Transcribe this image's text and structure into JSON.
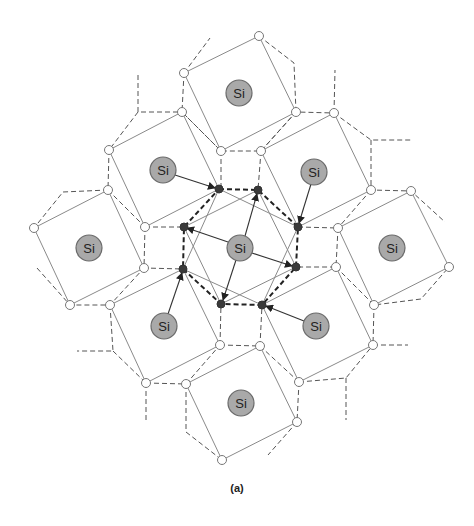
{
  "figure": {
    "caption": "(a)",
    "atom_label": "Si",
    "colors": {
      "si_fill": "#a9a9a9",
      "dark_node": "#3a3a3a",
      "solid_line": "#8a8a8a",
      "dashed_line": "#555555"
    },
    "si_atoms": [
      {
        "id": "center",
        "x": 240,
        "y": 248
      },
      {
        "id": "top",
        "x": 239,
        "y": 93
      },
      {
        "id": "top-left",
        "x": 163,
        "y": 170
      },
      {
        "id": "top-right",
        "x": 314,
        "y": 172
      },
      {
        "id": "left",
        "x": 89,
        "y": 248
      },
      {
        "id": "right",
        "x": 392,
        "y": 248
      },
      {
        "id": "bottom-left",
        "x": 164,
        "y": 326
      },
      {
        "id": "bottom-right",
        "x": 316,
        "y": 326
      },
      {
        "id": "bottom",
        "x": 241,
        "y": 403
      }
    ],
    "dark_nodes": [
      [
        219,
        189
      ],
      [
        258,
        190
      ],
      [
        298,
        227
      ],
      [
        296,
        267
      ],
      [
        262,
        305
      ],
      [
        221,
        304
      ],
      [
        183,
        269
      ],
      [
        184,
        227
      ]
    ]
  }
}
